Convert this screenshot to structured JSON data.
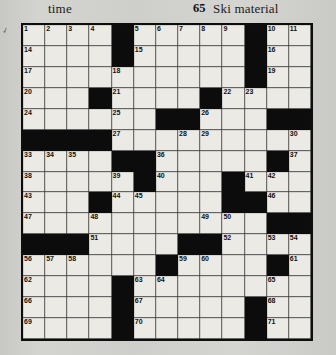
{
  "header": {
    "left_clue_fragment": "time",
    "right_clue_number": "65",
    "right_clue_text": "Ski material"
  },
  "grid": {
    "columns": 13,
    "rows": 15,
    "fill_color": "#eceae5",
    "block_color": "#0c0c0c",
    "border_color": "#0d0d0d",
    "cells": [
      [
        {
          "n": "1"
        },
        {
          "n": "2"
        },
        {
          "n": "3"
        },
        {
          "n": "4"
        },
        {
          "b": true
        },
        {
          "n": "5"
        },
        {
          "n": "6"
        },
        {
          "n": "7"
        },
        {
          "n": "8"
        },
        {
          "n": "9"
        },
        {
          "b": true
        },
        {
          "n": "10"
        },
        {
          "n": "11"
        },
        {
          "n": "12"
        },
        {
          "n": "13"
        }
      ],
      [
        {
          "n": "14"
        },
        {},
        {},
        {},
        {
          "b": true
        },
        {
          "n": "15"
        },
        {},
        {},
        {},
        {},
        {
          "b": true
        },
        {
          "n": "16"
        },
        {},
        {},
        {}
      ],
      [
        {
          "n": "17"
        },
        {},
        {},
        {},
        {
          "n": "18"
        },
        {},
        {},
        {},
        {},
        {},
        {
          "b": true
        },
        {
          "n": "19"
        },
        {},
        {},
        {}
      ],
      [
        {
          "n": "20"
        },
        {},
        {},
        {
          "b": true
        },
        {
          "n": "21"
        },
        {},
        {},
        {},
        {
          "b": true
        },
        {
          "n": "22"
        },
        {
          "n": "23"
        },
        {},
        {},
        {},
        {}
      ],
      [
        {
          "n": "24"
        },
        {},
        {},
        {},
        {
          "n": "25"
        },
        {},
        {
          "b": true
        },
        {
          "b": true
        },
        {
          "n": "26"
        },
        {},
        {},
        {
          "b": true
        },
        {
          "b": true
        },
        {
          "b": true
        },
        {}
      ],
      [
        {
          "b": true
        },
        {
          "b": true
        },
        {
          "b": true
        },
        {
          "b": true
        },
        {
          "n": "27"
        },
        {},
        {},
        {
          "n": "28"
        },
        {
          "n": "29"
        },
        {},
        {},
        {},
        {
          "n": "30"
        },
        {
          "n": "31"
        },
        {
          "n": "32"
        }
      ],
      [
        {
          "n": "33"
        },
        {
          "n": "34"
        },
        {
          "n": "35"
        },
        {},
        {
          "b": true
        },
        {
          "b": true
        },
        {
          "n": "36"
        },
        {},
        {},
        {},
        {},
        {
          "b": true
        },
        {
          "n": "37"
        },
        {},
        {}
      ],
      [
        {
          "n": "38"
        },
        {},
        {},
        {},
        {
          "n": "39"
        },
        {
          "b": true
        },
        {
          "n": "40"
        },
        {},
        {},
        {
          "b": true
        },
        {
          "n": "41"
        },
        {
          "n": "42"
        },
        {},
        {},
        {}
      ],
      [
        {
          "n": "43"
        },
        {},
        {},
        {
          "b": true
        },
        {
          "n": "44"
        },
        {
          "n": "45"
        },
        {},
        {},
        {},
        {
          "b": true
        },
        {
          "b": true
        },
        {
          "n": "46"
        },
        {},
        {},
        {}
      ],
      [
        {
          "n": "47"
        },
        {},
        {},
        {
          "n": "48"
        },
        {},
        {},
        {},
        {},
        {
          "n": "49"
        },
        {
          "n": "50"
        },
        {},
        {
          "b": true
        },
        {
          "b": true
        },
        {},
        {}
      ],
      [
        {
          "b": true
        },
        {
          "b": true
        },
        {
          "b": true
        },
        {
          "n": "51"
        },
        {},
        {},
        {},
        {
          "b": true
        },
        {
          "b": true
        },
        {
          "n": "52"
        },
        {},
        {
          "n": "53"
        },
        {
          "n": "54"
        },
        {
          "n": "55"
        },
        {}
      ],
      [
        {
          "n": "56"
        },
        {
          "n": "57"
        },
        {
          "n": "58"
        },
        {},
        {},
        {},
        {
          "b": true
        },
        {
          "n": "59"
        },
        {
          "n": "60"
        },
        {},
        {},
        {
          "b": true
        },
        {
          "n": "61"
        },
        {},
        {}
      ],
      [
        {
          "n": "62"
        },
        {},
        {},
        {},
        {
          "b": true
        },
        {
          "n": "63"
        },
        {
          "n": "64"
        },
        {},
        {},
        {},
        {},
        {
          "n": "65"
        },
        {},
        {},
        {}
      ],
      [
        {
          "n": "66"
        },
        {},
        {},
        {},
        {
          "b": true
        },
        {
          "n": "67"
        },
        {},
        {},
        {},
        {},
        {
          "b": true
        },
        {
          "n": "68"
        },
        {},
        {},
        {}
      ],
      [
        {
          "n": "69"
        },
        {},
        {},
        {},
        {
          "b": true
        },
        {
          "n": "70"
        },
        {},
        {},
        {},
        {},
        {
          "b": true
        },
        {
          "n": "71"
        },
        {},
        {},
        {}
      ]
    ]
  }
}
